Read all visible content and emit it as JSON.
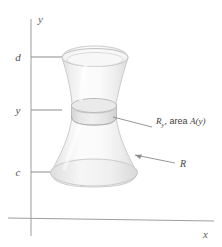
{
  "figure": {
    "background_color": "#ffffff",
    "axes": {
      "y_axis_label": "y",
      "x_axis_label": "x",
      "axis_color": "#9a9a9a"
    },
    "ticks": [
      {
        "label": "d",
        "name": "tick-d"
      },
      {
        "label": "y",
        "name": "tick-y"
      },
      {
        "label": "c",
        "name": "tick-c"
      }
    ],
    "annotations": {
      "cross_section": {
        "symbol": "R",
        "subscript": "y",
        "text": ", area ",
        "area_fn": "A",
        "area_arg": "(y)",
        "full": "R_y, area A(y)"
      },
      "solid": {
        "label": "R"
      }
    },
    "solid": {
      "name": "solid-of-revolution",
      "fill_light": "#fbfbfb",
      "fill_mid": "#f1f1f1",
      "fill_shadow": "#e3e3e3",
      "outline_color": "#c9c9c9",
      "slab_fill": "#e8e8e8"
    }
  }
}
